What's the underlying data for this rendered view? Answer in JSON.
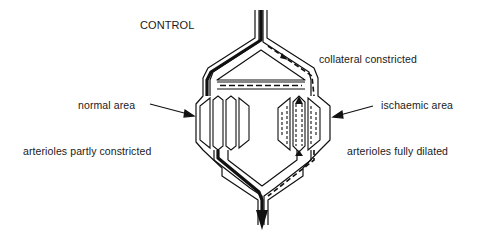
{
  "diagram": {
    "title": "CONTROL",
    "labels": {
      "collateral": "collateral constricted",
      "normal_area": "normal area",
      "ischaemic_area": "ischaemic area",
      "left_arterioles": "arterioles partly constricted",
      "right_arterioles": "arterioles fully dilated"
    },
    "colors": {
      "line": "#111111",
      "background": "#ffffff"
    }
  }
}
